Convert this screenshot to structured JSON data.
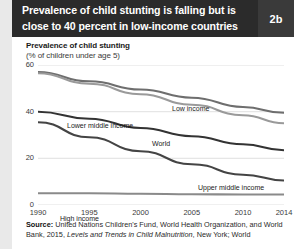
{
  "header": {
    "title": "Prevalence of child stunting is falling but is close to 40 percent in low-income countries",
    "badge": "2b"
  },
  "chart_data": {
    "type": "line",
    "title": "Prevalence of child stunting",
    "subtitle": "(% of children under age 5)",
    "xlabel": "",
    "ylabel": "Prevalence of child stunting (% of children under age 5)",
    "x": [
      1990,
      1995,
      2000,
      2005,
      2010,
      2014
    ],
    "xtick_labels": [
      "1990",
      "1995",
      "2000",
      "2005",
      "2010",
      "2014"
    ],
    "ytick_labels": [
      "0",
      "20",
      "40",
      "60"
    ],
    "yticks": [
      0,
      20,
      40,
      60
    ],
    "ylim": [
      0,
      60
    ],
    "xlim": [
      1990,
      2014
    ],
    "grid": true,
    "legend": "inline-labels",
    "series": [
      {
        "name": "Low income",
        "color": "#6e6e6e",
        "values": [
          57.0,
          53.0,
          49.5,
          46.0,
          42.0,
          39.5
        ],
        "label_x": 160,
        "label_y": 68
      },
      {
        "name": "Lower middle income",
        "color": "#9a9a9a",
        "values": [
          56.5,
          52.0,
          47.5,
          43.0,
          38.5,
          35.0
        ],
        "label_x": 55,
        "label_y": 85
      },
      {
        "name": "World",
        "color": "#333333",
        "values": [
          40.0,
          37.0,
          33.0,
          29.5,
          26.0,
          23.5
        ],
        "label_x": 140,
        "label_y": 103
      },
      {
        "name": "Upper middle income",
        "color": "#444444",
        "values": [
          35.5,
          29.0,
          23.0,
          17.5,
          13.0,
          10.5
        ],
        "label_x": 186,
        "label_y": 147
      },
      {
        "name": "High income",
        "color": "#8a8a8a",
        "values": [
          5.0,
          5.0,
          4.8,
          4.6,
          4.5,
          4.5
        ],
        "label_x": 48,
        "label_y": 178
      }
    ]
  },
  "source": {
    "prefix": "Source:",
    "text": " United Nations Children's Fund, World Health Organization, and World Bank, 2015, ",
    "italic": "Levels and Trends in Child Malnutrition",
    "suffix": ", New York; World"
  }
}
